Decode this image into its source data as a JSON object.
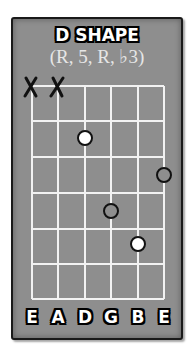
{
  "title": "D SHAPE",
  "subtitle": "(R, 5, R, ♭3)",
  "colors": {
    "card_bg": "#8e8e8e",
    "grid": "#f2f2f2",
    "root_dot": "#ffffff",
    "other_dot": "#8e8e8e",
    "outline": "#111111"
  },
  "muted_strings": [
    "E",
    "A"
  ],
  "string_labels": [
    "E",
    "A",
    "D",
    "G",
    "B",
    "E"
  ],
  "fret_count": 6,
  "dots": [
    {
      "string": "D",
      "fret": 2,
      "type": "root"
    },
    {
      "string": "E (high)",
      "fret": 3,
      "type": "other"
    },
    {
      "string": "G",
      "fret": 4,
      "type": "other"
    },
    {
      "string": "B",
      "fret": 5,
      "type": "root"
    }
  ]
}
